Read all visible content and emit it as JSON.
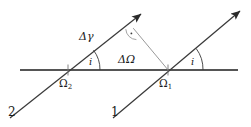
{
  "figure": {
    "background_color": "#ffffff",
    "width": 251,
    "height": 127,
    "colors": {
      "baseline": "#555555",
      "ray": "#3a3a3a",
      "helper_line": "#9a9a9a",
      "text": "#1a1a1a"
    }
  },
  "labels": {
    "delta_gamma": "Δγ",
    "delta_omega": "ΔΩ",
    "angle_i_left": "i",
    "angle_i_right": "i",
    "omega_two_base": "Ω",
    "omega_two_sub": "2",
    "omega_one_base": "Ω",
    "omega_one_sub": "1",
    "ray_two": "2",
    "ray_one": "1"
  },
  "geometry": {
    "baseline": {
      "x1": 20,
      "y1": 70,
      "x2": 238,
      "y2": 70
    },
    "intersection_omega_two": {
      "x": 68,
      "y": 70
    },
    "intersection_omega_one": {
      "x": 168,
      "y": 70
    },
    "ray_two_start": {
      "x": 10,
      "y": 118
    },
    "ray_two_tip": {
      "x": 146,
      "y": 10
    },
    "ray_one_start": {
      "x": 113,
      "y": 118
    },
    "ray_one_tip": {
      "x": 245,
      "y": 7
    },
    "helper_vertex": {
      "x": 133,
      "y": 28
    },
    "right_angle_marker": {
      "x": 137,
      "y": 36
    }
  }
}
